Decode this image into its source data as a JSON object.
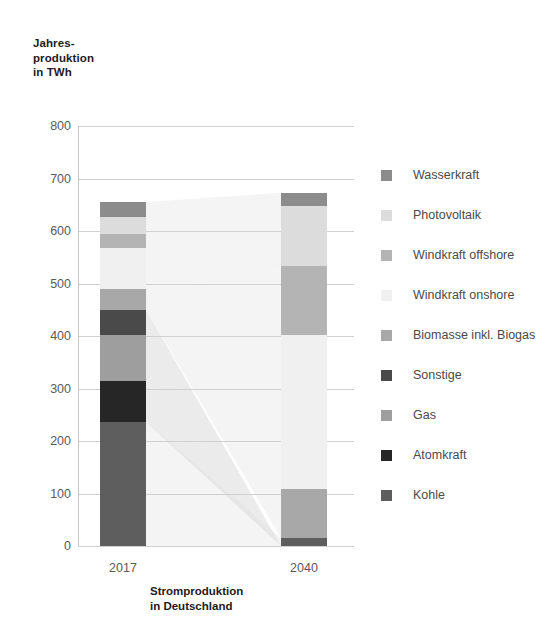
{
  "chart_data": {
    "type": "bar",
    "subtype": "stacked-bar-with-flow-ribbons",
    "title": "",
    "xlabel": "Stromproduktion\nin Deutschland",
    "ylabel": "Jahres-\nproduktion\nin TWh",
    "categories": [
      "2017",
      "2040"
    ],
    "ylim": [
      0,
      800
    ],
    "yticks": [
      800,
      700,
      600,
      500,
      400,
      300,
      200,
      100,
      0
    ],
    "grid": true,
    "legend_position": "right",
    "unit": "TWh",
    "series": [
      {
        "name": "Wasserkraft",
        "color": "#8c8c8c",
        "values": [
          29,
          25
        ]
      },
      {
        "name": "Photovoltaik",
        "color": "#dcdcdc",
        "values": [
          31,
          114
        ]
      },
      {
        "name": "Windkraft offshore",
        "color": "#b4b4b4",
        "values": [
          27,
          132
        ]
      },
      {
        "name": "Windkraft onshore",
        "color": "#f0f0f0",
        "values": [
          79,
          294
        ]
      },
      {
        "name": "Biomasse inkl. Biogas",
        "color": "#a8a8a8",
        "values": [
          39,
          93
        ]
      },
      {
        "name": "Sonstige",
        "color": "#4a4a4a",
        "values": [
          48,
          0
        ]
      },
      {
        "name": "Gas",
        "color": "#9e9e9e",
        "values": [
          87,
          0
        ]
      },
      {
        "name": "Atomkraft",
        "color": "#262626",
        "values": [
          79,
          0
        ]
      },
      {
        "name": "Kohle",
        "color": "#5e5e5e",
        "values": [
          236,
          15
        ]
      }
    ],
    "totals": [
      655,
      673
    ]
  },
  "axis": {
    "y_ticks": [
      "800",
      "700",
      "600",
      "500",
      "400",
      "300",
      "200",
      "100",
      "0"
    ],
    "x_ticks": [
      "2017",
      "2040"
    ],
    "y_title": "Jahres-\nproduktion\nin TWh",
    "x_title": "Stromproduktion\nin Deutschland"
  },
  "legend": {
    "items": [
      {
        "label": "Wasserkraft",
        "color": "#8c8c8c"
      },
      {
        "label": "Photovoltaik",
        "color": "#dcdcdc"
      },
      {
        "label": "Windkraft offshore",
        "color": "#b4b4b4"
      },
      {
        "label": "Windkraft onshore",
        "color": "#f0f0f0"
      },
      {
        "label": "Biomasse inkl. Biogas",
        "color": "#a8a8a8"
      },
      {
        "label": "Sonstige",
        "color": "#4a4a4a"
      },
      {
        "label": "Gas",
        "color": "#9e9e9e"
      },
      {
        "label": "Atomkraft",
        "color": "#262626"
      },
      {
        "label": "Kohle",
        "color": "#5e5e5e"
      }
    ]
  },
  "colors": {
    "grid": "#d0d0d0",
    "axis": "#c8c8c8",
    "tick_text": "#5a5a5a",
    "title_text": "#1c1c1c",
    "ribbon": "#dadada",
    "background": "#ffffff"
  }
}
